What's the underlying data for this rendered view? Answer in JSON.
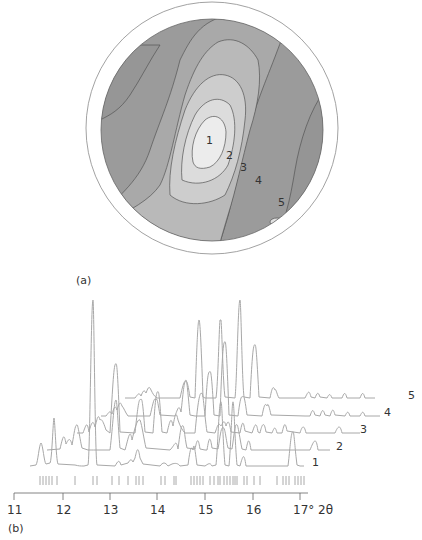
{
  "panel_a": {
    "label": "(a)",
    "contour_labels": [
      "1",
      "2",
      "3",
      "4",
      "5"
    ]
  },
  "panel_b": {
    "label": "(b)",
    "x_ticks": [
      "11",
      "12",
      "13",
      "14",
      "15",
      "16",
      "17° 2θ"
    ],
    "trace_labels": [
      "1",
      "2",
      "3",
      "4",
      "5"
    ]
  },
  "colors": {
    "outer_ring": "#8a8a8a",
    "contour_fill_outer": "#9d9d9d",
    "contour_fill_light": "#e8e8e8",
    "trace": "#a8a8a8",
    "axis": "#666666"
  }
}
